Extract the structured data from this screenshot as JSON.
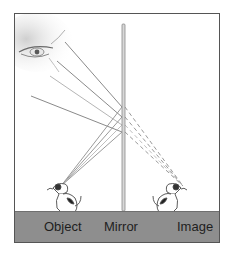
{
  "diagram": {
    "labels": {
      "object": "Object",
      "mirror": "Mirror",
      "image": "Image"
    },
    "elements": {
      "eye": "observer-eye",
      "mirror": "vertical-plane-mirror",
      "object": "dog-sitting-facing-left",
      "image": "dog-sitting-facing-right"
    },
    "rays": {
      "count": 5,
      "solid": "reflected-rays-eye-to-mirror-and-object-to-mirror",
      "dashed": "virtual-rays-behind-mirror-to-image"
    },
    "colors": {
      "frame_border": "#555555",
      "ground": "#8e8e8e",
      "mirror": "#9a9a9a",
      "ray": "#8a8a8a",
      "text": "#1e1e1e"
    }
  }
}
